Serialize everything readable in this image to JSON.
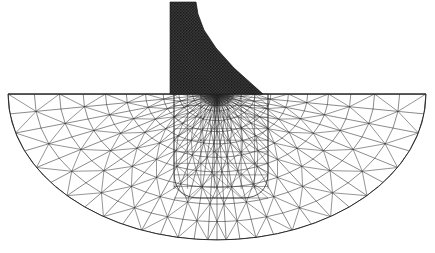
{
  "figure": {
    "title": "",
    "caption": "",
    "domain_type": "finite-element-mesh",
    "background_color": "#ffffff",
    "line_color": "#2b2b2b",
    "dam_fill_color": "#3a3a3a"
  },
  "chart_data": {
    "type": "diagram",
    "title": "",
    "subtitle": "",
    "xlabel": "",
    "ylabel": "",
    "legend": [],
    "annotations": [],
    "grid": false,
    "components": [
      {
        "name": "dam-structure",
        "kind": "dense-mesh-region",
        "outline": [
          [
            170,
            2
          ],
          [
            196,
            2
          ],
          [
            198,
            14
          ],
          [
            204,
            30
          ],
          [
            216,
            48
          ],
          [
            234,
            68
          ],
          [
            263,
            94
          ],
          [
            170,
            94
          ]
        ],
        "fill": "#3a3a3a",
        "mesh_density": "very-fine"
      },
      {
        "name": "foundation-domain",
        "kind": "semicircular-mesh",
        "surface_y": 94,
        "surface_x_left": 8,
        "surface_x_right": 426,
        "center_x": 217,
        "radius_x": 209,
        "radius_y": 146,
        "bottom_y": 240,
        "mesh_density": "graded"
      },
      {
        "name": "refined-zone",
        "kind": "inner-boundary",
        "shape": "rounded-rectangle",
        "x_left": 174,
        "x_right": 268,
        "y_top": 94,
        "y_bottom": 198,
        "corner_radius": 26
      }
    ],
    "mesh_parameters": {
      "radial_rings": 12,
      "angular_divisions": 30,
      "surface_refinement_factor": 0.18,
      "element_type": "triangle",
      "element_count_estimate": 980
    },
    "axis_ranges": {
      "x": [
        0,
        435
      ],
      "y": [
        0,
        253
      ]
    }
  }
}
